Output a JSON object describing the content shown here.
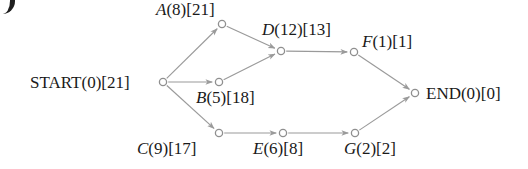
{
  "figure": {
    "type": "activity-on-node-network-diagram",
    "width": 528,
    "height": 169,
    "background_color": "#ffffff",
    "edge_color": "#9a9a9a",
    "node_stroke_color": "#8f8f8f",
    "node_fill_color": "#ffffff",
    "text_color": "#1a1a1a"
  },
  "nodes": [
    {
      "key": "start",
      "label": "START(0)[21]",
      "id_text": "START",
      "id_italic": false,
      "duration": "(0)",
      "slack": "[21]",
      "cx": 163,
      "cy": 82,
      "label_x": 30,
      "label_y": 74,
      "label_anchor": "left"
    },
    {
      "key": "a",
      "label": "A(8)[21]",
      "id_text": "A",
      "id_italic": true,
      "duration": "(8)",
      "slack": "[21]",
      "cx": 222,
      "cy": 24,
      "label_x": 156,
      "label_y": 1,
      "label_anchor": "left"
    },
    {
      "key": "b",
      "label": "B(5)[18]",
      "id_text": "B",
      "id_italic": true,
      "duration": "(5)",
      "slack": "[18]",
      "cx": 219,
      "cy": 82,
      "label_x": 196,
      "label_y": 89,
      "label_anchor": "left"
    },
    {
      "key": "c",
      "label": "C(9)[17]",
      "id_text": "C",
      "id_italic": true,
      "duration": "(9)",
      "slack": "[17]",
      "cx": 219,
      "cy": 133,
      "label_x": 137,
      "label_y": 140,
      "label_anchor": "left"
    },
    {
      "key": "d",
      "label": "D(12)[13]",
      "id_text": "D",
      "id_italic": true,
      "duration": "(12)",
      "slack": "[13]",
      "cx": 281,
      "cy": 51,
      "label_x": 262,
      "label_y": 21,
      "label_anchor": "left"
    },
    {
      "key": "e",
      "label": "E(6)[8]",
      "id_text": "E",
      "id_italic": true,
      "duration": "(6)",
      "slack": "[8]",
      "cx": 283,
      "cy": 133,
      "label_x": 253,
      "label_y": 140,
      "label_anchor": "left"
    },
    {
      "key": "f",
      "label": "F(1)[1]",
      "id_text": "F",
      "id_italic": true,
      "duration": "(1)",
      "slack": "[1]",
      "cx": 354,
      "cy": 52,
      "label_x": 362,
      "label_y": 33,
      "label_anchor": "left"
    },
    {
      "key": "g",
      "label": "G(2)[2]",
      "id_text": "G",
      "id_italic": true,
      "duration": "(2)",
      "slack": "[2]",
      "cx": 355,
      "cy": 133,
      "label_x": 344,
      "label_y": 140,
      "label_anchor": "left"
    },
    {
      "key": "end",
      "label": "END(0)[0]",
      "id_text": "END",
      "id_italic": false,
      "duration": "(0)",
      "slack": "[0]",
      "cx": 415,
      "cy": 93,
      "label_x": 426,
      "label_y": 85,
      "label_anchor": "left"
    }
  ],
  "edges": [
    {
      "key": "start-a",
      "from": "start",
      "to": "a"
    },
    {
      "key": "start-b",
      "from": "start",
      "to": "b"
    },
    {
      "key": "start-c",
      "from": "start",
      "to": "c"
    },
    {
      "key": "a-d",
      "from": "a",
      "to": "d"
    },
    {
      "key": "b-d",
      "from": "b",
      "to": "d"
    },
    {
      "key": "d-f",
      "from": "d",
      "to": "f"
    },
    {
      "key": "c-e",
      "from": "c",
      "to": "e"
    },
    {
      "key": "e-g",
      "from": "e",
      "to": "g"
    },
    {
      "key": "f-end",
      "from": "f",
      "to": "end"
    },
    {
      "key": "g-end",
      "from": "g",
      "to": "end"
    }
  ]
}
